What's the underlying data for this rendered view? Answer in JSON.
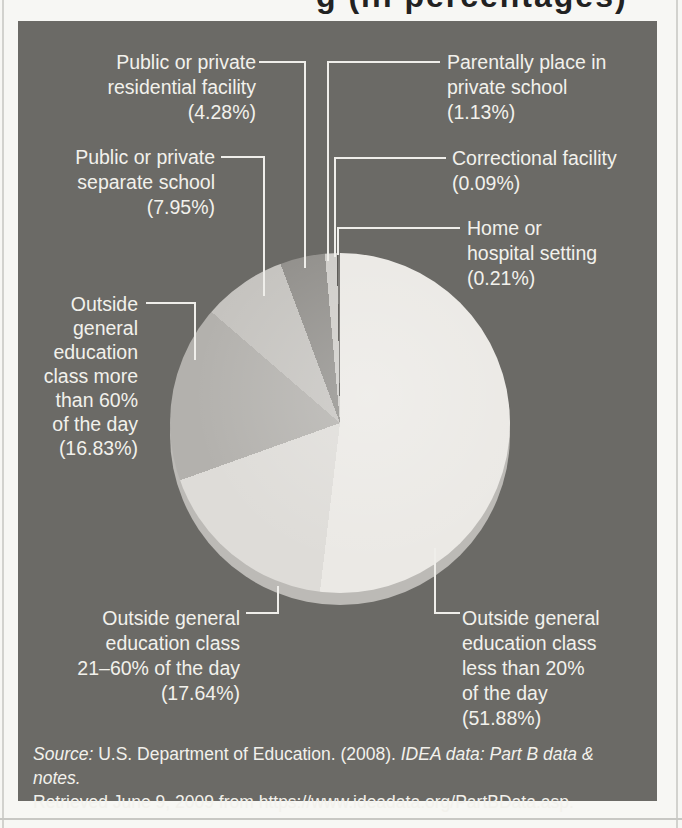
{
  "page": {
    "clipped_title_fragment": "g (in percentages)",
    "source": {
      "label_italic": "Source:",
      "line1_regular": " U.S. Department of Education. (2008). ",
      "line1_italic": "IDEA data: Part B data & notes.",
      "line2": "Retrieved June 9, 2009 from https://www.ideadata.org/PartBData.asp."
    }
  },
  "colors": {
    "panel_bg": "#6b6a66",
    "label_text": "#f2f1ec",
    "leader_line": "#efeeea",
    "pie_depth": "#bcbab6",
    "page_bg": "#f7f7f4",
    "title_text": "#222222"
  },
  "chart_data": {
    "type": "pie",
    "title": "",
    "start_angle_deg": 0,
    "direction": "clockwise",
    "legend_position": "callouts",
    "slices": [
      {
        "label": "Outside general education class less than 20% of the day",
        "pct": 51.88,
        "color": "#ebe9e5",
        "callout_lines": [
          "Outside general",
          "education class",
          "less than 20%",
          "of the day",
          "(51.88%)"
        ]
      },
      {
        "label": "Outside general education class 21–60% of the day",
        "pct": 17.64,
        "color": "#dedcd8",
        "callout_lines": [
          "Outside general",
          "education class",
          "21–60% of the day",
          "(17.64%)"
        ]
      },
      {
        "label": "Outside general education class more than 60% of the day",
        "pct": 16.83,
        "color": "#b3b1ad",
        "callout_lines": [
          "Outside",
          "general",
          "education",
          "class more",
          "than 60%",
          "of the day",
          "(16.83%)"
        ]
      },
      {
        "label": "Public or private separate school",
        "pct": 7.95,
        "color": "#c5c3bf",
        "callout_lines": [
          "Public or private",
          "separate school",
          "(7.95%)"
        ]
      },
      {
        "label": "Public or private residential facility",
        "pct": 4.28,
        "color": "#918f8b",
        "callout_lines": [
          "Public or private",
          "residential facility",
          "(4.28%)"
        ]
      },
      {
        "label": "Parentally place in private school",
        "pct": 1.13,
        "color": "#cfcdc9",
        "callout_lines": [
          "Parentally place in",
          "private school",
          "(1.13%)"
        ]
      },
      {
        "label": "Correctional facility",
        "pct": 0.09,
        "color": "#54524e",
        "callout_lines": [
          "Correctional facility",
          "(0.09%)"
        ]
      },
      {
        "label": "Home or hospital setting",
        "pct": 0.21,
        "color": "#75736f",
        "callout_lines": [
          "Home or",
          "hospital setting",
          "(0.21%)"
        ]
      }
    ]
  }
}
